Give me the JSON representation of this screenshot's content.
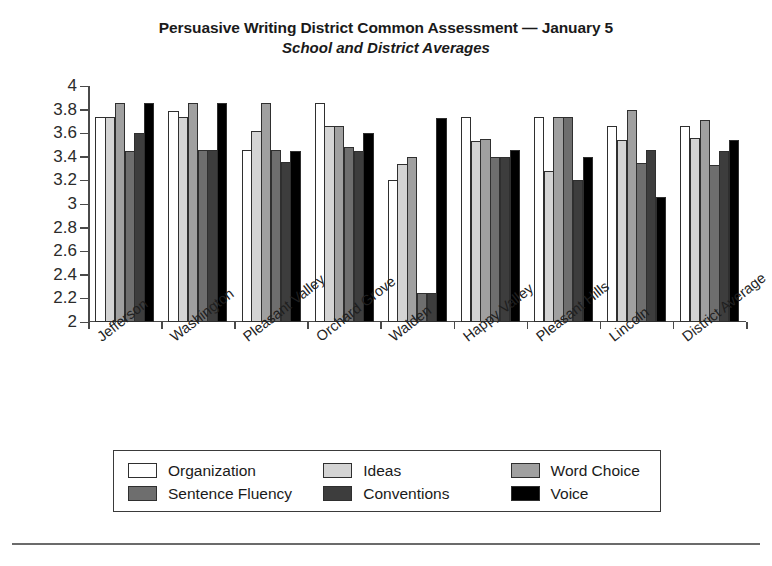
{
  "chart_data": {
    "type": "bar",
    "title": "Persuasive Writing District Common Assessment — January 5",
    "subtitle": "School and District Averages",
    "xlabel": "",
    "ylabel": "",
    "ylim": [
      2,
      4
    ],
    "ytick_step": 0.2,
    "grid": false,
    "legend_position": "bottom",
    "yticks": [
      "4",
      "3.8",
      "3.6",
      "3.4",
      "3.2",
      "3",
      "2.8",
      "2.6",
      "2.4",
      "2.2",
      "2"
    ],
    "ytick_values": [
      4,
      3.8,
      3.6,
      3.4,
      3.2,
      3,
      2.8,
      2.6,
      2.4,
      2.2,
      2
    ],
    "categories": [
      "Jefferson",
      "Washington",
      "Pleasant Valley",
      "Orchard Grove",
      "Walden",
      "Happy Valley",
      "Pleasant Hills",
      "Lincoln",
      "District Average"
    ],
    "series": [
      {
        "name": "Organization",
        "color": "#ffffff",
        "values": [
          3.74,
          3.79,
          3.46,
          3.86,
          3.2,
          3.74,
          3.74,
          3.66,
          3.66
        ]
      },
      {
        "name": "Ideas",
        "color": "#d4d4d4",
        "values": [
          3.74,
          3.74,
          3.62,
          3.66,
          3.34,
          3.53,
          3.28,
          3.54,
          3.56
        ]
      },
      {
        "name": "Word Choice",
        "color": "#a0a0a0",
        "values": [
          3.86,
          3.86,
          3.86,
          3.66,
          3.4,
          3.55,
          3.74,
          3.8,
          3.71
        ]
      },
      {
        "name": "Sentence Fluency",
        "color": "#6e6e6e",
        "values": [
          3.45,
          3.46,
          3.46,
          3.48,
          2.25,
          3.4,
          3.74,
          3.35,
          3.33
        ]
      },
      {
        "name": "Conventions",
        "color": "#3d3d3d",
        "values": [
          3.6,
          3.46,
          3.36,
          3.45,
          2.25,
          3.4,
          3.2,
          3.46,
          3.45
        ]
      },
      {
        "name": "Voice",
        "color": "#000000",
        "values": [
          3.86,
          3.86,
          3.45,
          3.6,
          3.73,
          3.46,
          3.4,
          3.06,
          3.54
        ]
      }
    ]
  },
  "legend": {
    "items": [
      {
        "label": "Organization",
        "swatch": "#ffffff"
      },
      {
        "label": "Ideas",
        "swatch": "#d4d4d4"
      },
      {
        "label": "Word Choice",
        "swatch": "#a0a0a0"
      },
      {
        "label": "Sentence Fluency",
        "swatch": "#6e6e6e"
      },
      {
        "label": "Conventions",
        "swatch": "#3d3d3d"
      },
      {
        "label": "Voice",
        "swatch": "#000000"
      }
    ]
  }
}
